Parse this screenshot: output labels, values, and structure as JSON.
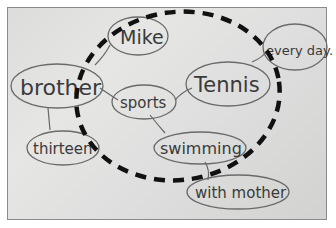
{
  "image": {
    "description": "Photo of a hand-drawn mind map on paper with a thick dashed circle",
    "nodes": {
      "mike": "Mike",
      "brother": "brother",
      "sports": "sports",
      "tennis": "Tennis",
      "every_day": "every day.",
      "thirteen": "thirteen",
      "swimming": "swimming",
      "with_mother": "with mother"
    },
    "colors": {
      "paper": "#e2e2e0",
      "pencil": "#555555",
      "dashed_circle": "#111111"
    }
  }
}
